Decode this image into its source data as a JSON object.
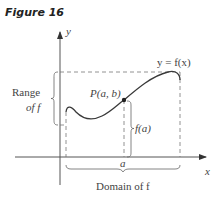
{
  "figure": {
    "title": "Figure 16"
  },
  "axes": {
    "x_label": "x",
    "y_label": "y"
  },
  "labels": {
    "curve": "y = f(x)",
    "point": "P(a, b)",
    "fa": "f(a)",
    "a_tick": "a",
    "range_line1": "Range",
    "range_line2": "of f",
    "domain": "Domain of f"
  },
  "colors": {
    "curve": "#3a3a3a",
    "axis": "#555555",
    "dashed": "#777777",
    "text": "#444444"
  }
}
